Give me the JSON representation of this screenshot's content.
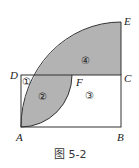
{
  "figure": {
    "caption": "图 5-2",
    "points": {
      "A": "A",
      "B": "B",
      "C": "C",
      "D": "D",
      "E": "E",
      "F": "F"
    },
    "regions": {
      "r1": "①",
      "r2": "②",
      "r3": "③",
      "r4": "④"
    },
    "colors": {
      "shade": "#b3b3b3",
      "stroke": "#333333"
    }
  }
}
